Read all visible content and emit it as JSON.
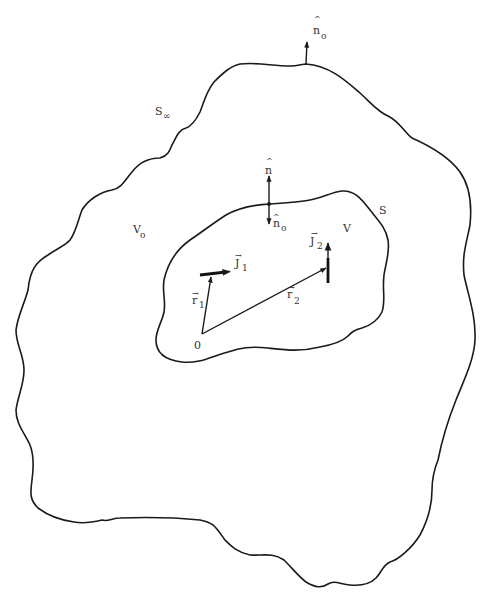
{
  "diagram": {
    "type": "volume-surface current distribution",
    "stroke_color": "#1a1a1a",
    "background": "#ffffff",
    "labels": {
      "outer_normal": {
        "base": "n",
        "accent": "^",
        "sub": "o"
      },
      "outer_surface": {
        "base": "S",
        "sub": "∞"
      },
      "outer_volume": {
        "base": "V",
        "sub": "o"
      },
      "inner_normal_out": {
        "base": "n",
        "accent": "^"
      },
      "inner_normal_in": {
        "base": "n",
        "accent": "^",
        "sub": "o"
      },
      "inner_surface": {
        "base": "S"
      },
      "inner_volume": {
        "base": "V"
      },
      "current_1": {
        "base": "J",
        "accent": "→",
        "sub": "1"
      },
      "current_2": {
        "base": "J",
        "accent": "→",
        "sub": "2"
      },
      "position_1": {
        "base": "r",
        "accent": "→",
        "sub": "1"
      },
      "position_2": {
        "base": "r",
        "accent": "→",
        "sub": "2"
      },
      "origin": {
        "base": "0"
      }
    }
  }
}
